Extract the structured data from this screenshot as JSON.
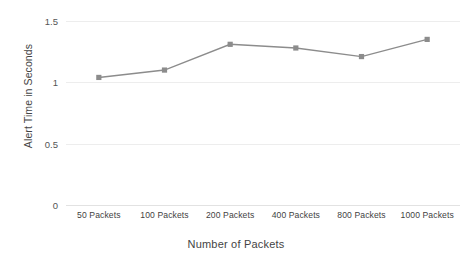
{
  "chart_data": {
    "type": "line",
    "title": "",
    "xlabel": "Number of Packets",
    "ylabel": "Alert Time in Seconds",
    "categories": [
      "50 Packets",
      "100 Packets",
      "200 Packets",
      "400 Packets",
      "800 Packets",
      "1000 Packets"
    ],
    "values": [
      1.04,
      1.1,
      1.31,
      1.28,
      1.21,
      1.35
    ],
    "series": [
      {
        "name": "Alert Time",
        "values": [
          1.04,
          1.1,
          1.31,
          1.28,
          1.21,
          1.35
        ],
        "color": "#8c8c8c"
      }
    ],
    "ylim": [
      0,
      1.5
    ],
    "yticks": [
      0,
      0.5,
      1,
      1.5
    ],
    "ytick_labels": [
      "0",
      "0.5",
      "1",
      "1.5"
    ],
    "grid": true,
    "legend": "none",
    "marker": "square",
    "line_color": "#8c8c8c",
    "gridline_color": "#ededed",
    "background": "#ffffff"
  }
}
